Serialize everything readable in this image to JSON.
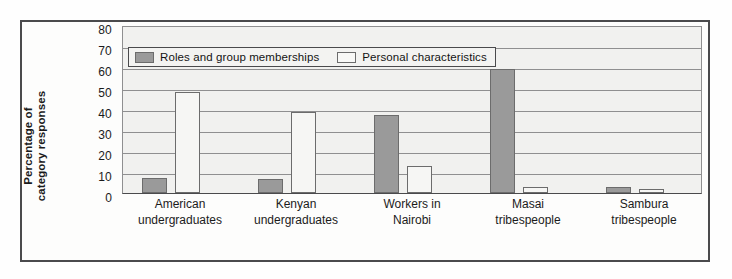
{
  "chart_data": {
    "type": "bar",
    "title": "",
    "xlabel": "",
    "ylabel_line1": "Percentage of",
    "ylabel_line2": "category responses",
    "ylim": [
      0,
      80
    ],
    "ytick_step": 10,
    "yticks": [
      "0",
      "10",
      "20",
      "30",
      "40",
      "50",
      "60",
      "70",
      "80"
    ],
    "grid": true,
    "legend_position": "top-center-inside",
    "categories": [
      [
        "American",
        "undergraduates"
      ],
      [
        "Kenyan",
        "undergraduates"
      ],
      [
        "Workers in",
        "Nairobi"
      ],
      [
        "Masai",
        "tribespeople"
      ],
      [
        "Sambura",
        "tribespeople"
      ]
    ],
    "category_labels_flat": [
      "American undergraduates",
      "Kenyan undergraduates",
      "Workers in Nairobi",
      "Masai tribespeople",
      "Sambura tribespeople"
    ],
    "series": [
      {
        "name": "Roles and group memberships",
        "key": "roles",
        "color": "#9a9a9a",
        "values": [
          7,
          6.5,
          37,
          59,
          3
        ]
      },
      {
        "name": "Personal characteristics",
        "key": "personal",
        "color": "#f6f6f4",
        "values": [
          48,
          38.5,
          13,
          3,
          2
        ]
      }
    ]
  },
  "legend": {
    "items": [
      {
        "label": "Roles and group memberships",
        "swatch": "roles"
      },
      {
        "label": "Personal characteristics",
        "swatch": "personal"
      }
    ]
  },
  "colors": {
    "bar_roles_fill": "#9a9a9a",
    "bar_personal_fill": "#f6f6f4",
    "bar_outline": "#6c6c6c",
    "plot_background": "#f1f1ef",
    "gridline": "#8f8f90",
    "frame_border": "#4a4a4c",
    "text": "#1b1b1b"
  }
}
